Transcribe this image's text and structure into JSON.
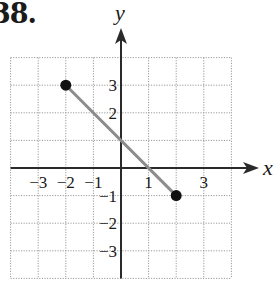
{
  "problem": {
    "number": "38."
  },
  "chart_data": {
    "type": "line",
    "title": "38.",
    "xlabel": "x",
    "ylabel": "y",
    "xlim": [
      -4,
      4
    ],
    "ylim": [
      -4,
      4
    ],
    "grid": true,
    "grid_style": "dotted",
    "x_tick_labels": [
      {
        "value": -3,
        "label": "−3"
      },
      {
        "value": -2,
        "label": "−2"
      },
      {
        "value": -1,
        "label": "−1"
      },
      {
        "value": 1,
        "label": "1"
      },
      {
        "value": 3,
        "label": "3"
      }
    ],
    "y_tick_labels": [
      {
        "value": 3,
        "label": "3"
      },
      {
        "value": 2,
        "label": "2"
      },
      {
        "value": -1,
        "label": "−1"
      },
      {
        "value": -2,
        "label": "−2"
      },
      {
        "value": -3,
        "label": "−3"
      }
    ],
    "series": [
      {
        "name": "line segment",
        "points": [
          {
            "x": -2,
            "y": 3
          },
          {
            "x": 2,
            "y": -1
          }
        ],
        "endpoints": "closed",
        "color": "#8c8c8c"
      }
    ]
  },
  "colors": {
    "axis": "#2a2a2a",
    "grid": "#9a9a9a",
    "segment": "#8c8c8c",
    "point": "#111111"
  }
}
